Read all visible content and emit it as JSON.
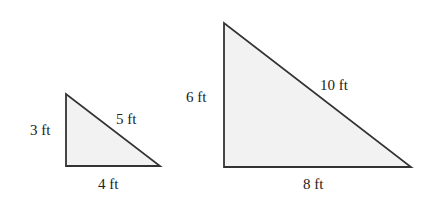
{
  "triangles": [
    {
      "name": "small",
      "vertical_side": "3 ft",
      "hypotenuse": "5 ft",
      "base": "4 ft"
    },
    {
      "name": "large",
      "vertical_side": "6 ft",
      "hypotenuse": "10 ft",
      "base": "8 ft"
    }
  ],
  "colors": {
    "fill": "#f2f2f2",
    "stroke": "#333333"
  }
}
